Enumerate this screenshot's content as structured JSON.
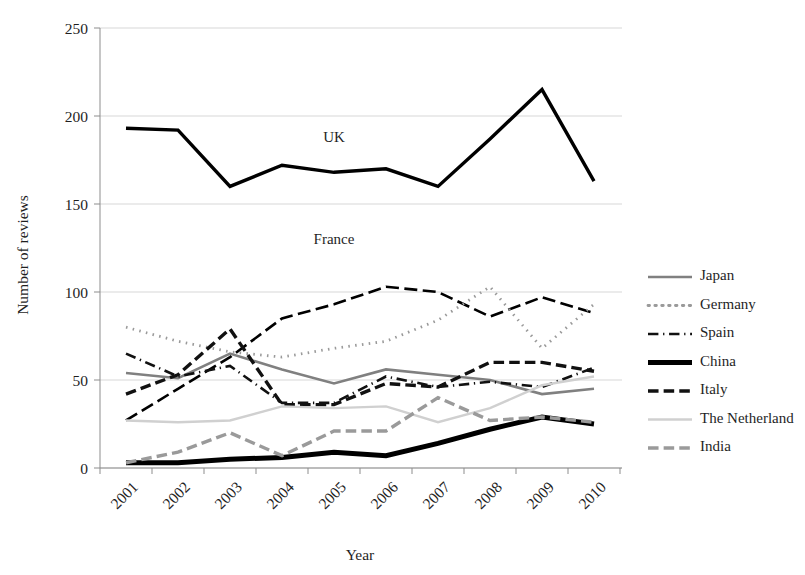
{
  "chart_data": {
    "type": "line",
    "title": "",
    "xlabel": "Year",
    "ylabel": "Number of reviews",
    "categories": [
      "2001",
      "2002",
      "2003",
      "2004",
      "2005",
      "2006",
      "2007",
      "2008",
      "2009",
      "2010"
    ],
    "ylim": [
      0,
      250
    ],
    "yticks": [
      0,
      50,
      100,
      150,
      200,
      250
    ],
    "grid": "horizontal",
    "legend_position": "right",
    "annotations": [
      {
        "text": "UK",
        "x_category": "2005",
        "y_value": 185
      },
      {
        "text": "France",
        "x_category": "2005",
        "y_value": 127
      }
    ],
    "series": [
      {
        "name": "UK",
        "style": "solid",
        "color": "#000000",
        "width": 3.4,
        "in_legend": false,
        "values": [
          193,
          192,
          160,
          172,
          168,
          170,
          160,
          187,
          215,
          163
        ]
      },
      {
        "name": "France",
        "style": "long-dash",
        "color": "#000000",
        "width": 2.6,
        "in_legend": false,
        "values": [
          27,
          45,
          63,
          85,
          93,
          103,
          100,
          86,
          97,
          88
        ]
      },
      {
        "name": "Japan",
        "style": "solid",
        "color": "#808080",
        "width": 2.6,
        "in_legend": true,
        "values": [
          54,
          51,
          65,
          56,
          48,
          56,
          53,
          50,
          42,
          45
        ]
      },
      {
        "name": "Germany",
        "style": "dotted",
        "color": "#9a9a9a",
        "width": 2.8,
        "in_legend": true,
        "values": [
          80,
          72,
          66,
          63,
          68,
          72,
          84,
          103,
          68,
          93
        ]
      },
      {
        "name": "Spain",
        "style": "dash-dot",
        "color": "#111111",
        "width": 2.6,
        "in_legend": true,
        "values": [
          65,
          52,
          58,
          37,
          37,
          52,
          46,
          49,
          46,
          57
        ]
      },
      {
        "name": "China",
        "style": "solid",
        "color": "#000000",
        "width": 5.0,
        "in_legend": true,
        "values": [
          3,
          3,
          5,
          6,
          9,
          7,
          14,
          22,
          29,
          25
        ]
      },
      {
        "name": "Italy",
        "style": "dash",
        "color": "#111111",
        "width": 3.4,
        "in_legend": true,
        "values": [
          42,
          53,
          79,
          36,
          36,
          48,
          46,
          60,
          60,
          55
        ]
      },
      {
        "name": "The Netherland",
        "style": "solid",
        "color": "#d0d0d0",
        "width": 2.4,
        "in_legend": true,
        "values": [
          27,
          26,
          27,
          35,
          34,
          35,
          26,
          34,
          47,
          52
        ]
      },
      {
        "name": "India",
        "style": "dash",
        "color": "#9a9a9a",
        "width": 3.4,
        "in_legend": true,
        "values": [
          3,
          9,
          20,
          7,
          21,
          21,
          40,
          27,
          29,
          26
        ]
      }
    ]
  },
  "legend": {
    "items": [
      {
        "label": "Japan"
      },
      {
        "label": "Germany"
      },
      {
        "label": "Spain"
      },
      {
        "label": "China"
      },
      {
        "label": "Italy"
      },
      {
        "label": "The Netherland"
      },
      {
        "label": "India"
      }
    ]
  }
}
